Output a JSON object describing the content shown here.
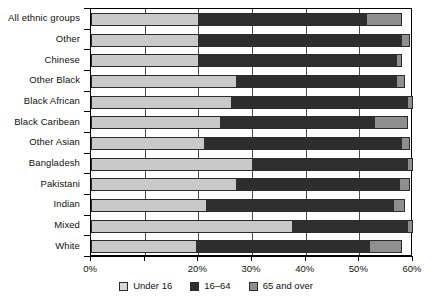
{
  "chart_data": {
    "type": "bar",
    "orientation": "horizontal",
    "stacked": true,
    "title": "",
    "xlabel": "",
    "ylabel": "",
    "xlim": [
      0,
      60
    ],
    "xticks": [
      "0%",
      "10%",
      "20%",
      "30%",
      "40%",
      "50%",
      "60%"
    ],
    "xtick_values": [
      0,
      10,
      20,
      30,
      40,
      50,
      60
    ],
    "xticks_labeled": [
      "0%",
      "20%",
      "30%",
      "40%",
      "50%",
      "60%"
    ],
    "grid": true,
    "legend_position": "bottom",
    "categories": [
      "All ethnic groups",
      "Other",
      "Chinese",
      "Other Black",
      "Black African",
      "Black Caribean",
      "Other Asian",
      "Bangladesh",
      "Pakistani",
      "Indian",
      "Mixed",
      "White"
    ],
    "series": [
      {
        "name": "Under 16",
        "color": "#c9c9c9",
        "values": [
          20.0,
          20.0,
          20.0,
          27.0,
          26.0,
          24.0,
          21.0,
          30.0,
          27.0,
          21.5,
          37.5,
          19.5
        ]
      },
      {
        "name": "16-64",
        "color": "#2e2e2e",
        "values": [
          31.5,
          38.0,
          37.0,
          30.0,
          33.0,
          29.0,
          37.0,
          29.0,
          30.5,
          35.0,
          21.5,
          32.5
        ]
      },
      {
        "name": "65 and over",
        "color": "#8f8f8f",
        "values": [
          6.5,
          1.5,
          1.0,
          1.5,
          1.0,
          6.0,
          1.5,
          1.0,
          2.0,
          2.0,
          1.0,
          6.0
        ]
      }
    ]
  },
  "legend": {
    "items": [
      {
        "label": "Under 16"
      },
      {
        "label": "16–64"
      },
      {
        "label": "65 and over"
      }
    ]
  }
}
